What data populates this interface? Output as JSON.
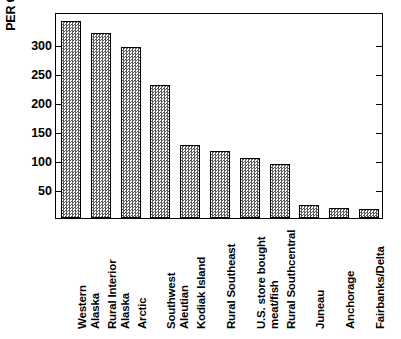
{
  "chart_data": {
    "type": "bar",
    "title": "",
    "xlabel": "",
    "ylabel": "PER CAPITA (kg)",
    "ylim": [
      0,
      355
    ],
    "yticks": [
      50,
      100,
      150,
      200,
      250,
      300
    ],
    "grid": false,
    "legend": null,
    "categories": [
      "Western\nAlaska",
      "Rural Interior\nAlaska",
      "Arctic",
      "Southwest\nAleutian",
      "Kodiak Island",
      "Rural Southeast",
      "U.S. store bought\nmeat/fish",
      "Rural Southcentral",
      "Juneau",
      "Anchorage",
      "Fairbanks/Delta"
    ],
    "values": [
      340,
      318,
      295,
      229,
      125,
      115,
      103,
      93,
      22,
      17,
      15
    ]
  },
  "axis": {
    "y_title": "PER CAPITA (kg)",
    "tick_labels": [
      "300",
      "250",
      "200",
      "150",
      "100",
      "50"
    ]
  }
}
